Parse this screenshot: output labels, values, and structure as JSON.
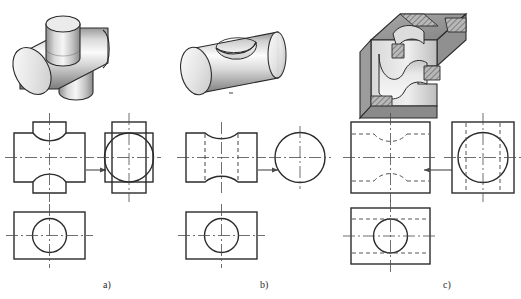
{
  "figure": {
    "background_color": "#ffffff",
    "line_color": "#2b2b2b",
    "hidden_line_color": "#555555",
    "center_line_color": "#4a4a4a",
    "shade_light": "#f2f2f2",
    "shade_mid": "#c9c9c9",
    "shade_dark": "#8f8f8f",
    "shade_darker": "#6e6e6e"
  },
  "columns": [
    {
      "id": "a",
      "label": "a)",
      "label_x": 103,
      "label_y": 282,
      "pictorial": {
        "name": "tee-junction-two-cylinders",
        "description": "Horizontal cylinder with a smaller vertical cylinder passing through it"
      },
      "views": {
        "front": {
          "name": "front-view-cross-shape",
          "description": "Cross / plus outline with concave circular notches top and bottom"
        },
        "side": {
          "name": "side-view-circle-in-rect",
          "description": "Circle inscribed with rectangular tabs above and below"
        },
        "top": {
          "name": "top-view-circle-in-rect",
          "description": "Rectangle with a centered circle"
        }
      },
      "arrow": {
        "name": "projection-arrow-right",
        "direction": "right"
      }
    },
    {
      "id": "b",
      "label": "b)",
      "label_x": 260,
      "label_y": 282,
      "pictorial": {
        "name": "cylinder-with-saddle-groove",
        "description": "Horizontal cylinder with a transverse semicircular groove cut in the top"
      },
      "views": {
        "front": {
          "name": "front-view-hourglass-shape",
          "description": "Hourglass outline with concave arcs top and bottom and vertical hidden lines"
        },
        "side": {
          "name": "side-view-circle",
          "description": "Plain circle with center lines"
        },
        "top": {
          "name": "top-view-circle-in-rect",
          "description": "Rectangle with a centered circle"
        }
      },
      "arrow": {
        "name": "projection-arrow-right",
        "direction": "right"
      }
    },
    {
      "id": "c",
      "label": "c)",
      "label_x": 443,
      "label_y": 282,
      "pictorial": {
        "name": "prism-block-with-cylindrical-cutouts",
        "description": "Rectangular block with cylindrical bore and transverse cylindrical relief, sectioned with hatching"
      },
      "views": {
        "front": {
          "name": "front-view-square-hidden-curves",
          "description": "Square outline with hidden concave curves top and bottom"
        },
        "side": {
          "name": "side-view-circle-in-square",
          "description": "Square with inscribed circle and hidden vertical lines"
        },
        "top": {
          "name": "top-view-circle-in-rect-hidden",
          "description": "Rectangle with centered circle and horizontal hidden lines"
        }
      },
      "arrow": {
        "name": "projection-arrow-left",
        "direction": "left"
      }
    }
  ]
}
